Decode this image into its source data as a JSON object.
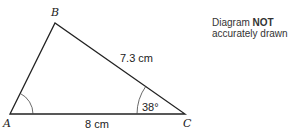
{
  "diagram": {
    "vertices": [
      {
        "label": "A",
        "x": 10,
        "y": 114
      },
      {
        "label": "B",
        "x": 55,
        "y": 23
      },
      {
        "label": "C",
        "x": 185,
        "y": 114
      }
    ],
    "sides": {
      "BC": "7.3 cm",
      "AC": "8 cm"
    },
    "angles": {
      "C": "38°",
      "A": ""
    },
    "note": {
      "prefix": "Diagram ",
      "bold": "NOT",
      "suffix": "accurately drawn"
    },
    "colors": {
      "line": "#222222",
      "text": "#222222"
    }
  }
}
